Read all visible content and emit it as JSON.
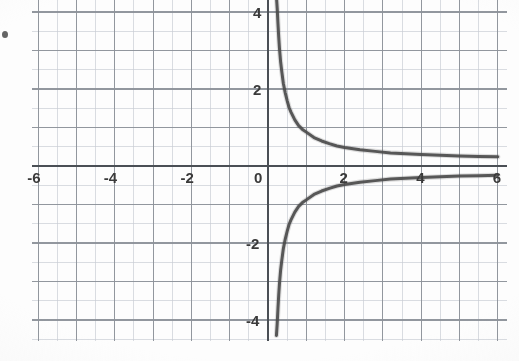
{
  "figure": {
    "name": "reciprocal-function-graph",
    "kind": "scanned-textbook-graph",
    "background_color": "#fdfdfd",
    "grid_color_minor": "#c9cdd4",
    "grid_color_major": "#8d9299",
    "axis_color": "#4a4f55",
    "curve_color": "#4b4b4b",
    "speck": {
      "x": 2,
      "y": 31
    }
  },
  "chart_data": {
    "type": "line",
    "title": "",
    "subtitle": "",
    "xlabel": "",
    "ylabel": "",
    "function": "y = 1/x",
    "xlim": [
      -6.2,
      6.2
    ],
    "ylim": [
      -4.4,
      4.4
    ],
    "grid": true,
    "minor_grid_step": 0.5,
    "major_grid_step": 1,
    "legend": "none",
    "xticks": [
      -6,
      -4,
      -2,
      0,
      2,
      4,
      6
    ],
    "xtick_labels": [
      "-6",
      "-4",
      "-2",
      "0",
      "2",
      "4",
      "6"
    ],
    "yticks": [
      4,
      2,
      -2,
      -4
    ],
    "ytick_labels": [
      "4",
      "2",
      "-2",
      "-4"
    ],
    "vertical_asymptote": 0.2,
    "horizontal_asymptote": 0,
    "series": [
      {
        "name": "upper-branch",
        "quadrant": "I",
        "x": [
          0.22,
          0.24,
          0.26,
          0.28,
          0.3,
          0.33,
          0.36,
          0.4,
          0.45,
          0.5,
          0.55,
          0.6,
          0.7,
          0.8,
          0.9,
          1.0,
          1.2,
          1.4,
          1.6,
          1.8,
          2.0,
          2.4,
          2.8,
          3.2,
          3.6,
          4.0,
          4.5,
          5.0,
          5.5,
          6.0
        ],
        "y": [
          4.4,
          4.1,
          3.7,
          3.35,
          3.05,
          2.7,
          2.45,
          2.15,
          1.9,
          1.7,
          1.52,
          1.4,
          1.2,
          1.05,
          0.95,
          0.88,
          0.74,
          0.65,
          0.58,
          0.52,
          0.48,
          0.42,
          0.38,
          0.34,
          0.32,
          0.3,
          0.28,
          0.26,
          0.25,
          0.24
        ]
      },
      {
        "name": "lower-branch",
        "quadrant": "IV",
        "x": [
          0.22,
          0.24,
          0.26,
          0.28,
          0.3,
          0.33,
          0.36,
          0.4,
          0.45,
          0.5,
          0.55,
          0.6,
          0.7,
          0.8,
          0.9,
          1.0,
          1.2,
          1.4,
          1.6,
          1.8,
          2.0,
          2.4,
          2.8,
          3.2,
          3.6,
          4.0,
          4.5,
          5.0,
          5.5,
          6.0
        ],
        "y": [
          -4.4,
          -4.1,
          -3.7,
          -3.35,
          -3.05,
          -2.7,
          -2.45,
          -2.15,
          -1.9,
          -1.7,
          -1.52,
          -1.4,
          -1.2,
          -1.05,
          -0.95,
          -0.88,
          -0.74,
          -0.65,
          -0.58,
          -0.52,
          -0.48,
          -0.42,
          -0.38,
          -0.34,
          -0.32,
          -0.3,
          -0.28,
          -0.26,
          -0.25,
          -0.24
        ]
      }
    ]
  },
  "axes": {
    "x_axis_name": "x-axis",
    "y_axis_name": "y-axis"
  }
}
